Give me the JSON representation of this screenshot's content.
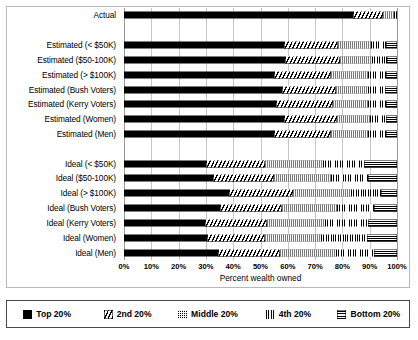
{
  "chart": {
    "type": "bar",
    "orientation": "horizontal",
    "stacked": true,
    "xlabel": "Percent wealth owned",
    "ylabel": "",
    "title": "",
    "xlim": [
      0,
      100
    ],
    "grid": true,
    "legend_position": "bottom",
    "xticks": [
      "0%",
      "10%",
      "20%",
      "30%",
      "40%",
      "50%",
      "60%",
      "70%",
      "80%",
      "90%",
      "100%"
    ],
    "xtick_values": [
      0,
      10,
      20,
      30,
      40,
      50,
      60,
      70,
      80,
      90,
      100
    ]
  },
  "chart_data": {
    "type": "bar",
    "orientation": "horizontal",
    "stacked": true,
    "title": "",
    "xlabel": "Percent wealth owned",
    "ylabel": "",
    "xlim": [
      0,
      100
    ],
    "grid": true,
    "legend_position": "bottom",
    "tick_labels": [
      "0%",
      "10%",
      "20%",
      "30%",
      "40%",
      "50%",
      "60%",
      "70%",
      "80%",
      "90%",
      "100%"
    ],
    "categories": [
      "Actual",
      "",
      "Estimated (< $50K)",
      "Estimated ($50-100K)",
      "Estimated (> $100K)",
      "Estimated (Bush Voters)",
      "Estimated (Kerry Voters)",
      "Estimated (Women)",
      "Estimated (Men)",
      "",
      "Ideal (< $50K)",
      "Ideal ($50-100K)",
      "Ideal (> $100K)",
      "Ideal (Bush Voters)",
      "Ideal (Kerry Voters)",
      "Ideal (Women)",
      "Ideal (Men)"
    ],
    "series": [
      {
        "name": "Top 20%",
        "pattern": "solid-black",
        "values": [
          84.0,
          null,
          58.5,
          59.0,
          55.0,
          58.0,
          55.5,
          58.5,
          55.0,
          null,
          30.0,
          32.5,
          38.5,
          35.0,
          29.5,
          30.5,
          34.5
        ]
      },
      {
        "name": "2nd 20%",
        "pattern": "diagonal-hatch",
        "values": [
          11.0,
          null,
          20.0,
          20.0,
          21.0,
          19.5,
          21.0,
          19.5,
          21.0,
          null,
          21.5,
          22.5,
          23.5,
          23.0,
          23.0,
          21.0,
          22.5
        ]
      },
      {
        "name": "Middle 20%",
        "pattern": "dotted",
        "values": [
          4.0,
          null,
          12.0,
          12.0,
          13.5,
          12.0,
          13.0,
          12.0,
          13.5,
          null,
          21.5,
          21.0,
          21.0,
          20.0,
          21.0,
          20.5,
          20.5
        ]
      },
      {
        "name": "4th 20%",
        "pattern": "vertical-lines",
        "values": [
          0.5,
          null,
          5.5,
          5.5,
          6.5,
          6.0,
          6.5,
          6.0,
          6.5,
          null,
          15.0,
          13.5,
          11.0,
          13.5,
          16.0,
          17.0,
          14.0
        ]
      },
      {
        "name": "Bottom 20%",
        "pattern": "horizontal-lines",
        "values": [
          0.5,
          null,
          4.0,
          3.5,
          4.0,
          4.5,
          4.0,
          4.0,
          4.0,
          null,
          12.0,
          10.5,
          6.0,
          8.5,
          10.5,
          11.0,
          8.5
        ]
      }
    ]
  },
  "legend": {
    "items": [
      {
        "label": "Top 20%",
        "pattern": "solid-black"
      },
      {
        "label": "2nd 20%",
        "pattern": "diagonal-hatch"
      },
      {
        "label": "Middle 20%",
        "pattern": "dotted"
      },
      {
        "label": "4th 20%",
        "pattern": "vertical-lines"
      },
      {
        "label": "Bottom 20%",
        "pattern": "horizontal-lines"
      }
    ]
  }
}
